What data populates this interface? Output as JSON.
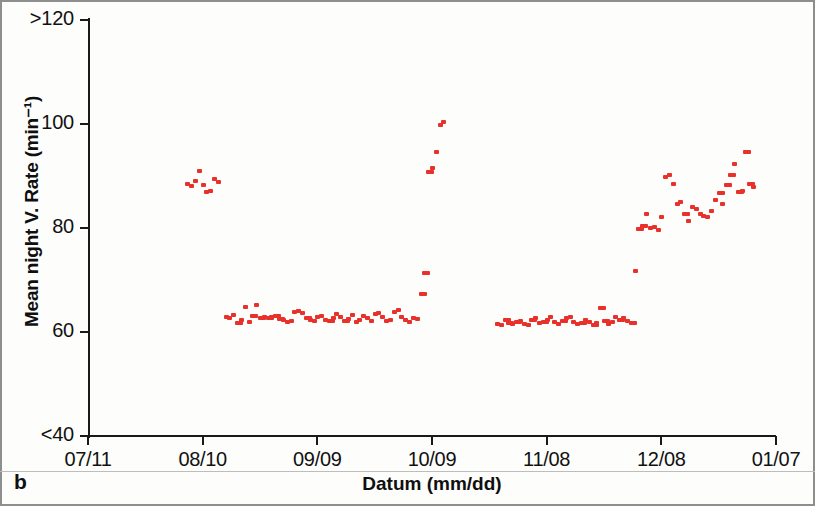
{
  "panel": {
    "letter": "b"
  },
  "chart_data": {
    "type": "scatter",
    "title": "",
    "xlabel": "Datum (mm/dd)",
    "ylabel": "Mean night V. Rate (min⁻¹)",
    "xtick_labels": [
      "07/11",
      "08/10",
      "09/09",
      "10/09",
      "11/08",
      "12/08",
      "01/07"
    ],
    "ytick_labels": [
      ">120",
      "100",
      "80",
      "60",
      "<40"
    ],
    "ytick_values": [
      120,
      100,
      80,
      60,
      40
    ],
    "ylim": [
      40,
      120
    ],
    "xlim": [
      "07/11",
      "01/07"
    ],
    "grid": false,
    "legend": false,
    "marker_color": "#e8312a",
    "marker_shape": "square",
    "series": [
      {
        "name": "Mean night ventricular rate",
        "points": [
          {
            "x": "08/06",
            "y": 88.5
          },
          {
            "x": "08/07",
            "y": 88.0
          },
          {
            "x": "08/08",
            "y": 89.0
          },
          {
            "x": "08/09",
            "y": 91.0
          },
          {
            "x": "08/10",
            "y": 88.2
          },
          {
            "x": "08/11",
            "y": 87.0
          },
          {
            "x": "08/12",
            "y": 87.2
          },
          {
            "x": "08/13",
            "y": 89.4
          },
          {
            "x": "08/14",
            "y": 88.8
          },
          {
            "x": "08/16",
            "y": 62.8
          },
          {
            "x": "08/17",
            "y": 62.6
          },
          {
            "x": "08/18",
            "y": 63.2
          },
          {
            "x": "08/19",
            "y": 61.8
          },
          {
            "x": "08/20",
            "y": 62.4
          },
          {
            "x": "08/21",
            "y": 64.8
          },
          {
            "x": "08/22",
            "y": 62.0
          },
          {
            "x": "08/23",
            "y": 63.0
          },
          {
            "x": "08/24",
            "y": 65.2
          },
          {
            "x": "08/25",
            "y": 62.6
          },
          {
            "x": "08/26",
            "y": 62.8
          },
          {
            "x": "08/27",
            "y": 62.7
          },
          {
            "x": "08/28",
            "y": 62.9
          },
          {
            "x": "08/29",
            "y": 63.0
          },
          {
            "x": "08/30",
            "y": 62.5
          },
          {
            "x": "08/31",
            "y": 62.4
          },
          {
            "x": "09/01",
            "y": 62.0
          },
          {
            "x": "09/02",
            "y": 62.2
          },
          {
            "x": "09/03",
            "y": 63.8
          },
          {
            "x": "09/04",
            "y": 64.0
          },
          {
            "x": "09/05",
            "y": 63.6
          },
          {
            "x": "09/06",
            "y": 62.6
          },
          {
            "x": "09/07",
            "y": 62.4
          },
          {
            "x": "09/08",
            "y": 62.2
          },
          {
            "x": "09/09",
            "y": 62.8
          },
          {
            "x": "09/10",
            "y": 63.0
          },
          {
            "x": "09/11",
            "y": 62.4
          },
          {
            "x": "09/12",
            "y": 62.1
          },
          {
            "x": "09/13",
            "y": 62.6
          },
          {
            "x": "09/14",
            "y": 63.4
          },
          {
            "x": "09/15",
            "y": 62.8
          },
          {
            "x": "09/16",
            "y": 62.2
          },
          {
            "x": "09/17",
            "y": 62.5
          },
          {
            "x": "09/18",
            "y": 63.2
          },
          {
            "x": "09/19",
            "y": 62.0
          },
          {
            "x": "09/20",
            "y": 62.4
          },
          {
            "x": "09/21",
            "y": 63.0
          },
          {
            "x": "09/22",
            "y": 62.6
          },
          {
            "x": "09/23",
            "y": 62.2
          },
          {
            "x": "09/24",
            "y": 63.4
          },
          {
            "x": "09/25",
            "y": 63.6
          },
          {
            "x": "09/26",
            "y": 62.8
          },
          {
            "x": "09/27",
            "y": 62.2
          },
          {
            "x": "09/28",
            "y": 62.4
          },
          {
            "x": "09/29",
            "y": 63.8
          },
          {
            "x": "09/30",
            "y": 64.2
          },
          {
            "x": "10/01",
            "y": 62.9
          },
          {
            "x": "10/02",
            "y": 62.4
          },
          {
            "x": "10/03",
            "y": 62.0
          },
          {
            "x": "10/04",
            "y": 62.6
          },
          {
            "x": "10/05",
            "y": 62.5
          },
          {
            "x": "10/06",
            "y": 67.4
          },
          {
            "x": "10/07",
            "y": 71.4
          },
          {
            "x": "10/08",
            "y": 90.8
          },
          {
            "x": "10/09",
            "y": 91.6
          },
          {
            "x": "10/10",
            "y": 94.6
          },
          {
            "x": "10/11",
            "y": 99.8
          },
          {
            "x": "10/12",
            "y": 100.4
          },
          {
            "x": "10/26",
            "y": 61.6
          },
          {
            "x": "10/27",
            "y": 61.4
          },
          {
            "x": "10/28",
            "y": 62.4
          },
          {
            "x": "10/29",
            "y": 61.8
          },
          {
            "x": "10/30",
            "y": 61.6
          },
          {
            "x": "10/31",
            "y": 62.0
          },
          {
            "x": "11/01",
            "y": 62.2
          },
          {
            "x": "11/02",
            "y": 61.6
          },
          {
            "x": "11/03",
            "y": 61.4
          },
          {
            "x": "11/04",
            "y": 62.4
          },
          {
            "x": "11/05",
            "y": 62.6
          },
          {
            "x": "11/06",
            "y": 61.8
          },
          {
            "x": "11/07",
            "y": 62.0
          },
          {
            "x": "11/08",
            "y": 62.4
          },
          {
            "x": "11/09",
            "y": 62.8
          },
          {
            "x": "11/10",
            "y": 61.9
          },
          {
            "x": "11/11",
            "y": 61.5
          },
          {
            "x": "11/12",
            "y": 62.2
          },
          {
            "x": "11/13",
            "y": 62.6
          },
          {
            "x": "11/14",
            "y": 62.8
          },
          {
            "x": "11/15",
            "y": 62.0
          },
          {
            "x": "11/16",
            "y": 61.6
          },
          {
            "x": "11/17",
            "y": 61.8
          },
          {
            "x": "11/18",
            "y": 62.4
          },
          {
            "x": "11/19",
            "y": 62.0
          },
          {
            "x": "11/20",
            "y": 61.4
          },
          {
            "x": "11/21",
            "y": 61.8
          },
          {
            "x": "11/22",
            "y": 64.6
          },
          {
            "x": "11/23",
            "y": 62.2
          },
          {
            "x": "11/24",
            "y": 61.6
          },
          {
            "x": "11/25",
            "y": 62.0
          },
          {
            "x": "11/26",
            "y": 62.8
          },
          {
            "x": "11/27",
            "y": 62.4
          },
          {
            "x": "11/28",
            "y": 62.6
          },
          {
            "x": "11/29",
            "y": 62.2
          },
          {
            "x": "11/30",
            "y": 61.8
          },
          {
            "x": "12/01",
            "y": 71.8
          },
          {
            "x": "12/02",
            "y": 79.8
          },
          {
            "x": "12/03",
            "y": 80.4
          },
          {
            "x": "12/04",
            "y": 82.6
          },
          {
            "x": "12/05",
            "y": 80.0
          },
          {
            "x": "12/06",
            "y": 80.2
          },
          {
            "x": "12/07",
            "y": 79.6
          },
          {
            "x": "12/08",
            "y": 82.2
          },
          {
            "x": "12/09",
            "y": 89.8
          },
          {
            "x": "12/10",
            "y": 90.2
          },
          {
            "x": "12/11",
            "y": 88.4
          },
          {
            "x": "12/12",
            "y": 84.6
          },
          {
            "x": "12/13",
            "y": 85.0
          },
          {
            "x": "12/14",
            "y": 82.6
          },
          {
            "x": "12/15",
            "y": 81.4
          },
          {
            "x": "12/16",
            "y": 84.0
          },
          {
            "x": "12/17",
            "y": 83.6
          },
          {
            "x": "12/18",
            "y": 82.6
          },
          {
            "x": "12/19",
            "y": 82.4
          },
          {
            "x": "12/20",
            "y": 82.2
          },
          {
            "x": "12/21",
            "y": 83.2
          },
          {
            "x": "12/22",
            "y": 85.4
          },
          {
            "x": "12/23",
            "y": 86.8
          },
          {
            "x": "12/24",
            "y": 84.6
          },
          {
            "x": "12/25",
            "y": 88.2
          },
          {
            "x": "12/26",
            "y": 90.2
          },
          {
            "x": "12/27",
            "y": 92.4
          },
          {
            "x": "12/28",
            "y": 87.0
          },
          {
            "x": "12/29",
            "y": 87.2
          },
          {
            "x": "12/30",
            "y": 94.6
          },
          {
            "x": "12/31",
            "y": 88.4
          },
          {
            "x": "01/01",
            "y": 87.8
          }
        ]
      }
    ]
  }
}
